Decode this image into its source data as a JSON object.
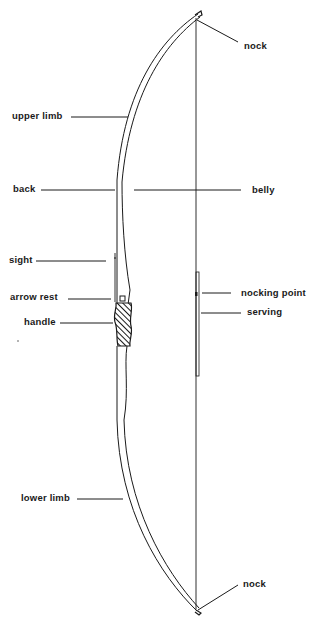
{
  "diagram": {
    "labels": {
      "nock_top": "nock",
      "upper_limb": "upper limb",
      "back": "back",
      "belly": "belly",
      "sight": "sight",
      "arrow_rest": "arrow rest",
      "nocking_point": "nocking point",
      "serving": "serving",
      "handle": "handle",
      "lower_limb": "lower limb",
      "nock_bottom": "nock"
    },
    "colors": {
      "ink": "#1a1a1a",
      "background": "#ffffff"
    }
  }
}
